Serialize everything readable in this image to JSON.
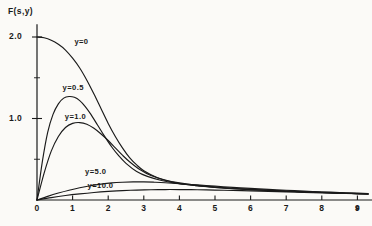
{
  "chart_data": {
    "type": "line",
    "title": "",
    "subtitle": "",
    "ylabel": "F(s,y)",
    "xlabel": "s",
    "xlim": [
      0,
      9.3
    ],
    "ylim": [
      0,
      2.15
    ],
    "grid": false,
    "legend_position": "inline-curve-labels",
    "xticks": [
      0,
      1,
      2,
      3,
      4,
      5,
      6,
      7,
      8,
      9
    ],
    "xtick_labels": [
      "0",
      "1",
      "2",
      "3",
      "4",
      "5",
      "6",
      "7",
      "8",
      "9"
    ],
    "yticks": [
      1.0,
      2.0
    ],
    "ytick_labels": [
      "1.0",
      "2.0"
    ],
    "y_minor_ticks": [
      0.5,
      1.5
    ],
    "series": [
      {
        "name": "y=0",
        "label": "y=0",
        "label_x": 1.05,
        "label_y": 1.94,
        "x": [
          0,
          0.2,
          0.4,
          0.6,
          0.8,
          1.0,
          1.2,
          1.4,
          1.6,
          1.8,
          2.0,
          2.2,
          2.4,
          2.6,
          2.8,
          3.0,
          3.4,
          3.8,
          4.2,
          4.6,
          5.0,
          5.5,
          6.0,
          6.5,
          7.0,
          7.5,
          8.0,
          8.5,
          9.0,
          9.3
        ],
        "y": [
          2.0,
          1.99,
          1.96,
          1.91,
          1.84,
          1.74,
          1.62,
          1.47,
          1.3,
          1.12,
          0.94,
          0.78,
          0.64,
          0.52,
          0.43,
          0.36,
          0.27,
          0.22,
          0.19,
          0.17,
          0.155,
          0.14,
          0.128,
          0.118,
          0.108,
          0.1,
          0.092,
          0.085,
          0.078,
          0.074
        ]
      },
      {
        "name": "y=0.5",
        "label": "y=0.5",
        "label_x": 0.72,
        "label_y": 1.37,
        "x": [
          0,
          0.15,
          0.3,
          0.45,
          0.6,
          0.75,
          0.9,
          1.05,
          1.2,
          1.35,
          1.5,
          1.7,
          1.9,
          2.1,
          2.3,
          2.5,
          2.8,
          3.1,
          3.5,
          4.0,
          4.5,
          5.0,
          5.5,
          6.0,
          6.5,
          7.0,
          7.5,
          8.0,
          8.5,
          9.0,
          9.3
        ],
        "y": [
          0,
          0.47,
          0.83,
          1.05,
          1.18,
          1.25,
          1.27,
          1.26,
          1.22,
          1.15,
          1.06,
          0.92,
          0.78,
          0.65,
          0.54,
          0.45,
          0.35,
          0.29,
          0.24,
          0.2,
          0.175,
          0.155,
          0.14,
          0.128,
          0.118,
          0.108,
          0.1,
          0.092,
          0.085,
          0.078,
          0.074
        ]
      },
      {
        "name": "y=1.0",
        "label": "y=1.0",
        "label_x": 0.78,
        "label_y": 1.02,
        "x": [
          0,
          0.2,
          0.4,
          0.6,
          0.8,
          1.0,
          1.2,
          1.4,
          1.6,
          1.8,
          2.0,
          2.2,
          2.4,
          2.6,
          2.9,
          3.2,
          3.6,
          4.0,
          4.5,
          5.0,
          5.5,
          6.0,
          6.5,
          7.0,
          7.5,
          8.0,
          8.5,
          9.0,
          9.3
        ],
        "y": [
          0,
          0.33,
          0.6,
          0.78,
          0.89,
          0.94,
          0.95,
          0.93,
          0.88,
          0.81,
          0.73,
          0.64,
          0.55,
          0.47,
          0.37,
          0.3,
          0.245,
          0.21,
          0.18,
          0.16,
          0.143,
          0.13,
          0.119,
          0.109,
          0.1,
          0.092,
          0.085,
          0.078,
          0.074
        ]
      },
      {
        "name": "y=5.0",
        "label": "y=5.0",
        "label_x": 1.35,
        "label_y": 0.345,
        "x": [
          0,
          0.3,
          0.6,
          0.9,
          1.2,
          1.5,
          1.8,
          2.1,
          2.4,
          2.7,
          3.0,
          3.3,
          3.6,
          4.0,
          4.5,
          5.0,
          5.5,
          6.0,
          6.5,
          7.0,
          7.5,
          8.0,
          8.5,
          9.0,
          9.3
        ],
        "y": [
          0,
          0.045,
          0.085,
          0.12,
          0.15,
          0.175,
          0.195,
          0.21,
          0.218,
          0.222,
          0.222,
          0.218,
          0.212,
          0.2,
          0.185,
          0.17,
          0.155,
          0.142,
          0.13,
          0.119,
          0.109,
          0.1,
          0.092,
          0.084,
          0.079
        ]
      },
      {
        "name": "y=10.0",
        "label": "y=10.0",
        "label_x": 1.42,
        "label_y": 0.175,
        "x": [
          0,
          0.4,
          0.8,
          1.2,
          1.6,
          2.0,
          2.4,
          2.8,
          3.2,
          3.6,
          4.0,
          4.5,
          5.0,
          5.5,
          6.0,
          6.5,
          7.0,
          7.5,
          8.0,
          8.5,
          9.0,
          9.3
        ],
        "y": [
          0,
          0.03,
          0.055,
          0.075,
          0.092,
          0.105,
          0.115,
          0.122,
          0.126,
          0.128,
          0.128,
          0.126,
          0.122,
          0.117,
          0.112,
          0.106,
          0.1,
          0.094,
          0.088,
          0.082,
          0.077,
          0.074
        ]
      }
    ],
    "colors": {
      "ink": "#1a1a1a",
      "paper": "#fbfaf7"
    }
  }
}
